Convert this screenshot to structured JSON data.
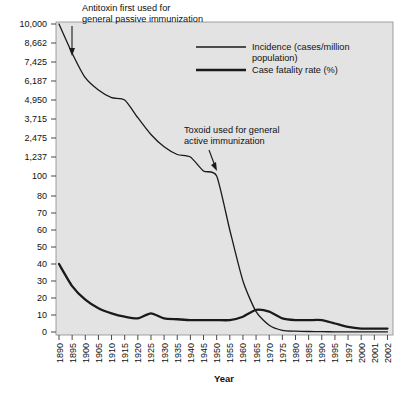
{
  "chart_data": {
    "type": "line",
    "title": "",
    "xlabel": "Year",
    "ylabel": "",
    "grid": false,
    "legend_position": "top-right",
    "y_axis": {
      "scale": "piecewise (broken axis: 0-100 linear lower band, 100-10,000 linear upper band)",
      "tick_labels": [
        "10,000",
        "8,662",
        "7,425",
        "6,187",
        "4,950",
        "3,715",
        "2,475",
        "1,237",
        "100",
        "80",
        "70",
        "60",
        "50",
        "40",
        "30",
        "20",
        "10",
        "0"
      ],
      "tick_values": [
        10000,
        8662,
        7425,
        6187,
        4950,
        3715,
        2475,
        1237,
        100,
        80,
        70,
        60,
        50,
        40,
        30,
        20,
        10,
        0
      ]
    },
    "x_axis": {
      "tick_labels": [
        "1890",
        "1895",
        "1900",
        "1905",
        "1910",
        "1915",
        "1920",
        "1925",
        "1930",
        "1935",
        "1940",
        "1945",
        "1950",
        "1955",
        "1960",
        "1965",
        "1970",
        "1975",
        "1980",
        "1985",
        "1990",
        "1995",
        "1997",
        "2000",
        "2001",
        "2002"
      ],
      "note": "ticks equally spaced by position; spacing irregular in years after 1995"
    },
    "series": [
      {
        "name": "Incidence (cases/million population)",
        "style": "thin-line",
        "x": [
          "1890",
          "1895",
          "1900",
          "1905",
          "1910",
          "1915",
          "1920",
          "1925",
          "1930",
          "1935",
          "1940",
          "1945",
          "1950",
          "1955",
          "1960",
          "1965",
          "1970",
          "1975",
          "1980",
          "1985",
          "1990",
          "1995",
          "1997",
          "2000",
          "2001",
          "2002"
        ],
        "values": [
          10000,
          8000,
          6400,
          5600,
          5100,
          4950,
          3800,
          2700,
          1900,
          1400,
          1237,
          400,
          100,
          60,
          30,
          12,
          4,
          1,
          0.5,
          0.3,
          0.2,
          0.1,
          0.1,
          0.05,
          0.05,
          0.05
        ]
      },
      {
        "name": "Case fatality rate (%)",
        "style": "thick-line",
        "x": [
          "1890",
          "1895",
          "1900",
          "1905",
          "1910",
          "1915",
          "1920",
          "1925",
          "1930",
          "1935",
          "1940",
          "1945",
          "1950",
          "1955",
          "1960",
          "1965",
          "1970",
          "1975",
          "1980",
          "1985",
          "1990",
          "1995",
          "1997",
          "2000",
          "2001",
          "2002"
        ],
        "values": [
          40,
          27,
          19,
          14,
          11,
          9,
          8,
          11,
          8,
          7.5,
          7,
          7,
          7,
          7,
          9,
          13,
          12,
          8,
          7,
          7,
          7,
          5,
          3,
          2,
          2,
          2
        ]
      }
    ],
    "annotations": [
      {
        "id": "antitoxin",
        "lines": [
          "Antitoxin first used for",
          "general passive immunization"
        ],
        "points_to": "1893 on incidence curve"
      },
      {
        "id": "toxoid",
        "lines": [
          "Toxoid used for general",
          "active immunization"
        ],
        "points_to": "1940 on incidence curve"
      }
    ],
    "colors": {
      "plot_background": "#e3e3e3",
      "page_background": "#ffffff",
      "line": "#1a1a1a",
      "axis": "#555555",
      "text": "#111111"
    }
  }
}
